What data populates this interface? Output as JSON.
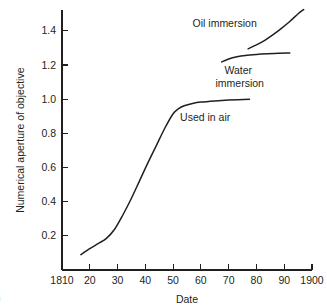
{
  "figure": {
    "tag": ")"
  },
  "chart_data": {
    "type": "line",
    "title": "",
    "xlabel": "Date",
    "ylabel": "Numerical aperture of objective",
    "xlim": [
      1810,
      1900
    ],
    "ylim": [
      0.0,
      1.52
    ],
    "grid": false,
    "legend_position": "inline-annotations",
    "x_ticks": [
      1810,
      1820,
      1830,
      1840,
      1850,
      1860,
      1870,
      1880,
      1890,
      1900
    ],
    "x_tick_labels": [
      "1810",
      "20",
      "30",
      "40",
      "50",
      "60",
      "70",
      "80",
      "90",
      "1900"
    ],
    "y_ticks": [
      0.2,
      0.4,
      0.6,
      0.8,
      1.0,
      1.2,
      1.4
    ],
    "y_tick_labels": [
      "0.2",
      "0.4",
      "0.6",
      "0.8",
      "1.0",
      "1.2",
      "1.4"
    ],
    "series": [
      {
        "name": "Used in air",
        "annotation": "Used in air",
        "annotation_x": 1852.5,
        "annotation_y": 0.875,
        "x": [
          1816.8,
          1820,
          1823,
          1826,
          1829,
          1832,
          1835,
          1838,
          1841,
          1844,
          1847,
          1850,
          1852,
          1854,
          1857,
          1860,
          1865,
          1870,
          1877.5
        ],
        "values": [
          0.09,
          0.125,
          0.155,
          0.185,
          0.24,
          0.325,
          0.42,
          0.525,
          0.63,
          0.73,
          0.83,
          0.915,
          0.945,
          0.962,
          0.975,
          0.983,
          0.99,
          0.995,
          1.0
        ]
      },
      {
        "name": "Water immersion",
        "annotation": "Water\nimmersion",
        "annotation_line1": "Water",
        "annotation_line2": "immersion",
        "annotation_x": 1868.5,
        "annotation_y": 1.145,
        "x": [
          1867.5,
          1870,
          1873,
          1876,
          1880,
          1884,
          1888,
          1892
        ],
        "values": [
          1.218,
          1.235,
          1.248,
          1.256,
          1.262,
          1.266,
          1.269,
          1.27
        ]
      },
      {
        "name": "Oil immersion",
        "annotation": "Oil immersion",
        "annotation_x": 1857,
        "annotation_y": 1.425,
        "x": [
          1877,
          1880,
          1883,
          1886,
          1889,
          1892,
          1895,
          1897
        ],
        "values": [
          1.295,
          1.318,
          1.345,
          1.378,
          1.415,
          1.455,
          1.5,
          1.525
        ]
      }
    ]
  }
}
